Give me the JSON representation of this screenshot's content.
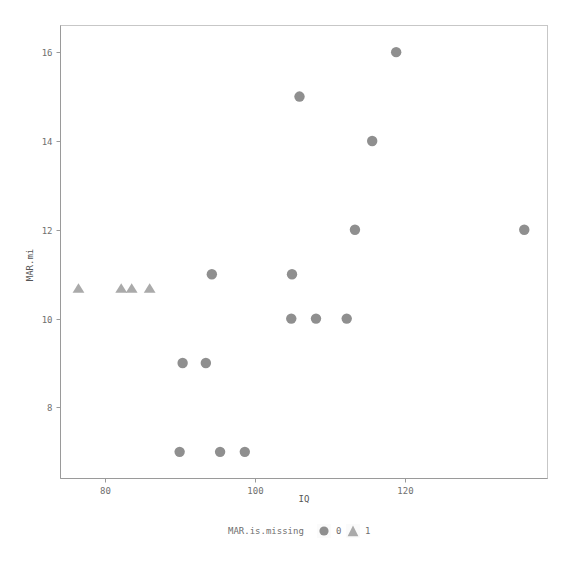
{
  "chart_data": {
    "type": "scatter",
    "title": "",
    "xlabel": "IQ",
    "ylabel": "MAR.mi",
    "xlim": [
      74,
      139
    ],
    "ylim": [
      6.4,
      16.6
    ],
    "xticks": [
      80,
      100,
      120
    ],
    "yticks": [
      8,
      10,
      12,
      14,
      16
    ],
    "grid": false,
    "legend": {
      "title": "MAR.is.missing",
      "position": "bottom",
      "entries": [
        {
          "label": "0",
          "marker": "circle",
          "color": "#8f8f8f"
        },
        {
          "label": "1",
          "marker": "triangle",
          "color": "#aaaaaa"
        }
      ]
    },
    "series": [
      {
        "name": "0",
        "marker": "circle",
        "color": "#8f8f8f",
        "points": [
          {
            "x": 118.8,
            "y": 16
          },
          {
            "x": 105.9,
            "y": 15
          },
          {
            "x": 115.6,
            "y": 14
          },
          {
            "x": 113.3,
            "y": 12
          },
          {
            "x": 135.9,
            "y": 12
          },
          {
            "x": 94.2,
            "y": 11
          },
          {
            "x": 104.9,
            "y": 11
          },
          {
            "x": 104.8,
            "y": 10
          },
          {
            "x": 108.1,
            "y": 10
          },
          {
            "x": 112.2,
            "y": 10
          },
          {
            "x": 90.3,
            "y": 9
          },
          {
            "x": 93.4,
            "y": 9
          },
          {
            "x": 89.9,
            "y": 7
          },
          {
            "x": 95.3,
            "y": 7
          },
          {
            "x": 98.6,
            "y": 7
          }
        ]
      },
      {
        "name": "1",
        "marker": "triangle",
        "color": "#aaaaaa",
        "points": [
          {
            "x": 76.4,
            "y": 10.67
          },
          {
            "x": 82.1,
            "y": 10.67
          },
          {
            "x": 83.5,
            "y": 10.67
          },
          {
            "x": 85.9,
            "y": 10.67
          }
        ]
      }
    ]
  },
  "axes": {
    "x_tick_labels": [
      "80",
      "100",
      "120"
    ],
    "y_tick_labels": [
      "16",
      "14",
      "12",
      "10",
      "8"
    ],
    "x_title": "IQ",
    "y_title": "MAR.mi"
  },
  "legend": {
    "title": "MAR.is.missing",
    "item0_label": "0",
    "item1_label": "1"
  },
  "colors": {
    "point_circle": "#8f8f8f",
    "point_triangle": "#aaaaaa",
    "axis_line": "#9a9a9a",
    "panel_border": "#bdbdbd",
    "text": "#6f6f6f",
    "background": "#ffffff"
  }
}
